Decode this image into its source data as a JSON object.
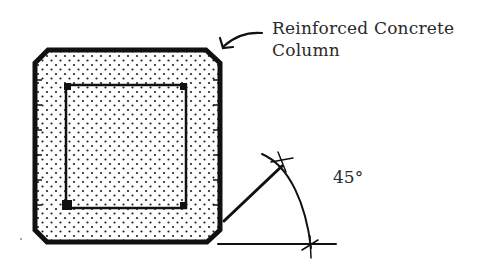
{
  "diagram": {
    "label": {
      "line1": "Reinforced Concrete",
      "line2": "Column"
    },
    "angle_label": "45°",
    "colors": {
      "stroke": "#111111",
      "text": "#2a2a2a",
      "background": "#ffffff"
    },
    "elements": [
      {
        "name": "column-cross-section",
        "shape": "chamfered-square",
        "fill": "stippled"
      },
      {
        "name": "reinforcement-tie",
        "shape": "square",
        "corner_bars": 4
      },
      {
        "name": "label-arrow",
        "points_to": "column-cross-section"
      },
      {
        "name": "angle-construction",
        "angle_degrees": 45
      }
    ]
  }
}
